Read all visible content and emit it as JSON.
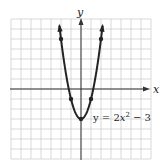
{
  "chart_data": {
    "type": "line",
    "title": "",
    "xlabel": "x",
    "ylabel": "y",
    "equation_label": "y = 2x² − 3",
    "equation_parts": {
      "pre": "y = 2",
      "var": "x",
      "exp": "2",
      "post": " − 3"
    },
    "xlim": [
      -7,
      7
    ],
    "ylim": [
      -7,
      7
    ],
    "grid": true,
    "grid_step": 1,
    "series": [
      {
        "name": "y = 2x^2 - 3",
        "x": [
          -2.16,
          -2,
          -1.5,
          -1,
          -0.5,
          0,
          0.5,
          1,
          1.5,
          2,
          2.16
        ],
        "values": [
          6.33,
          5,
          1.5,
          -1,
          -2.5,
          -3,
          -2.5,
          -1,
          1.5,
          5,
          6.33
        ]
      }
    ],
    "marked_points": [
      {
        "x": -2,
        "y": 5
      },
      {
        "x": -1,
        "y": -1
      },
      {
        "x": 0,
        "y": -3
      },
      {
        "x": 1,
        "y": -1
      },
      {
        "x": 2,
        "y": 5
      }
    ],
    "colors": {
      "curve": "#222222",
      "grid": "#c8c8c8",
      "axis": "#333333"
    }
  }
}
